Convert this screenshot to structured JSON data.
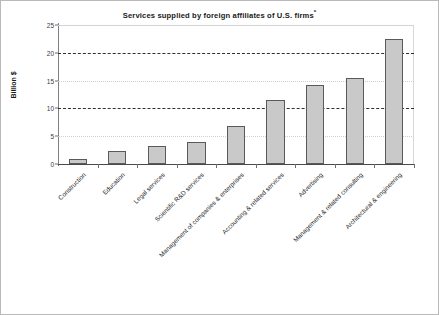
{
  "chart_data": {
    "type": "bar",
    "title": "Services supplied by foreign affiliates of U.S. firms*",
    "title_main": "Services supplied by foreign affiliates of U.S. firms",
    "title_footnote_marker": "*",
    "xlabel": "",
    "ylabel": "Billion $",
    "ylim": [
      0,
      25
    ],
    "yticks": [
      0,
      5,
      10,
      15,
      20,
      25
    ],
    "ytick_labels": [
      "0",
      "5",
      "10",
      "15",
      "20",
      "25"
    ],
    "grid": true,
    "grid_axis": "y",
    "legend": false,
    "bar_fill_color": "#c9c9c9",
    "bar_edge_color": "#5a5a5a",
    "categories": [
      "Construction",
      "Education",
      "Legal services",
      "Scientific R&D services",
      "Management of companies & enterprises",
      "Accounting & related services",
      "Advertising",
      "Management & related consulting",
      "Architectural & engineering"
    ],
    "values": [
      0.9,
      2.4,
      3.2,
      4.0,
      6.9,
      11.5,
      14.2,
      15.4,
      22.5
    ]
  }
}
